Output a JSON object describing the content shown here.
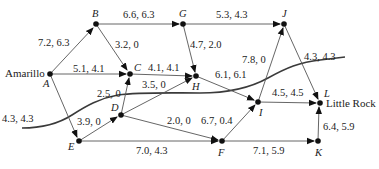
{
  "cities": {
    "source": "Amarillo",
    "sink": "Little Rock"
  },
  "nodes": [
    {
      "id": "A",
      "x": 50,
      "y": 74
    },
    {
      "id": "B",
      "x": 96,
      "y": 24
    },
    {
      "id": "C",
      "x": 130,
      "y": 74
    },
    {
      "id": "G",
      "x": 183,
      "y": 24
    },
    {
      "id": "H",
      "x": 196,
      "y": 76
    },
    {
      "id": "J",
      "x": 284,
      "y": 24
    },
    {
      "id": "D",
      "x": 121,
      "y": 115
    },
    {
      "id": "E",
      "x": 79,
      "y": 141
    },
    {
      "id": "F",
      "x": 222,
      "y": 141
    },
    {
      "id": "I",
      "x": 258,
      "y": 102
    },
    {
      "id": "L",
      "x": 320,
      "y": 103
    },
    {
      "id": "K",
      "x": 318,
      "y": 141
    }
  ],
  "edges": [
    {
      "from": "A",
      "to": "B",
      "label": "7.2, 6.3"
    },
    {
      "from": "A",
      "to": "C",
      "label": "5.1, 4.1"
    },
    {
      "from": "A",
      "to": "E",
      "label": "4.3, 4.3"
    },
    {
      "from": "B",
      "to": "G",
      "label": "6.6, 6.3"
    },
    {
      "from": "B",
      "to": "C",
      "label": "3.2, 0"
    },
    {
      "from": "C",
      "to": "H",
      "label": "4.1, 4.1"
    },
    {
      "from": "D",
      "to": "C",
      "label": "2.5, 0"
    },
    {
      "from": "D",
      "to": "H",
      "label": "3.5, 0"
    },
    {
      "from": "E",
      "to": "D",
      "label": "3.9, 0"
    },
    {
      "from": "D",
      "to": "F",
      "label": "2.0, 0"
    },
    {
      "from": "E",
      "to": "F",
      "label": "7.0, 4.3"
    },
    {
      "from": "G",
      "to": "J",
      "label": "5.3, 4.3"
    },
    {
      "from": "G",
      "to": "H",
      "label": "4.7, 2.0"
    },
    {
      "from": "H",
      "to": "I",
      "label": "6.1, 6.1"
    },
    {
      "from": "I",
      "to": "J",
      "label": "7.8, 0"
    },
    {
      "from": "J",
      "to": "L",
      "label": "4.3, 4.3"
    },
    {
      "from": "I",
      "to": "L",
      "label": "4.5, 4.5"
    },
    {
      "from": "F",
      "to": "I",
      "label": "6.7, 0.4"
    },
    {
      "from": "F",
      "to": "K",
      "label": "7.1, 5.9"
    },
    {
      "from": "K",
      "to": "L",
      "label": "6.4, 5.9"
    }
  ],
  "labels": {
    "AB": "7.2, 6.3",
    "AC": "5.1, 4.1",
    "AE": "4.3, 4.3",
    "BG": "6.6, 6.3",
    "BC": "3.2, 0",
    "CH": "4.1, 4.1",
    "DC": "2.5, 0",
    "DH": "3.5, 0",
    "ED": "3.9, 0",
    "DF": "2.0, 0",
    "EF": "7.0, 4.3",
    "GJ": "5.3, 4.3",
    "GH": "4.7, 2.0",
    "HI": "6.1, 6.1",
    "IJ": "7.8, 0",
    "JL": "4.3, 4.3",
    "IL": "4.5, 4.5",
    "FI": "6.7, 0.4",
    "FK": "7.1, 5.9",
    "KL": "6.4, 5.9"
  },
  "node_letters": {
    "A": "A",
    "B": "B",
    "C": "C",
    "D": "D",
    "E": "E",
    "F": "F",
    "G": "G",
    "H": "H",
    "I": "I",
    "J": "J",
    "K": "K",
    "L": "L"
  },
  "colors": {
    "line": "#555555",
    "node": "#111111",
    "river": "#3a3a3a",
    "text": "#222222"
  }
}
